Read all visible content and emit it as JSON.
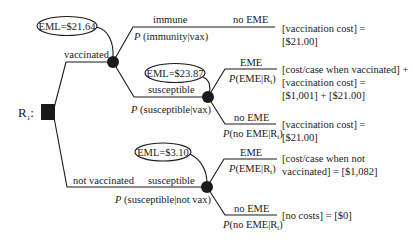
{
  "diagram": {
    "type": "decision-tree",
    "decision_node": {
      "label": "R",
      "label_subscript": "1",
      "label_suffix": ":"
    },
    "branches": {
      "vaccinated": {
        "label": "vaccinated",
        "eml": "EML=$21.64",
        "immune": {
          "label": "immune",
          "prob": "(immunity|vax)",
          "outcome_label": "no EME",
          "payoff_line1": "[vaccination cost] =",
          "payoff_line2": "[$21.00]"
        },
        "susceptible": {
          "label": "susceptible",
          "prob": "(susceptible|vax)",
          "eml": "EML=$23.87",
          "eme": {
            "label": "EME",
            "prob_main": "(EME|R",
            "prob_sub": "i",
            "prob_close": ")",
            "payoff_line1": "[cost/case when vaccinated] +",
            "payoff_line2": "[vaccination cost] =",
            "payoff_line3": "[$1,001] + [$21.00]"
          },
          "no_eme": {
            "label": "no EME",
            "prob_main": "(no EME|R",
            "prob_sub": "i",
            "prob_close": ")",
            "payoff_line1": "[vaccination cost] =",
            "payoff_line2": "[$21.00]"
          }
        }
      },
      "not_vaccinated": {
        "label": "not vaccinated",
        "susceptible_label": "susceptible",
        "prob": "(susceptible|not vax)",
        "eml": "EML=$3.10",
        "eme": {
          "label": "EME",
          "prob_main": "(EME|R",
          "prob_sub": "i",
          "prob_close": ")",
          "payoff_line1": "[cost/case when not",
          "payoff_line2": "vaccinated] = [$1,082]"
        },
        "no_eme": {
          "label": "no EME",
          "prob_main": "(no EME|R",
          "prob_sub": "i",
          "prob_close": ")",
          "payoff_line1": "[no costs] = [$0]"
        }
      }
    },
    "prob_symbol": "P",
    "colors": {
      "ink": "#1a1a1a",
      "background": "#ffffff"
    }
  }
}
